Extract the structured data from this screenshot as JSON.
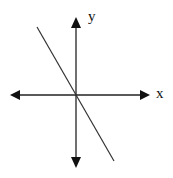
{
  "diagram": {
    "type": "coordinate-plane",
    "axes": {
      "x_label": "x",
      "y_label": "y",
      "origin": [
        76,
        95
      ],
      "x_axis": {
        "from": [
          10,
          95
        ],
        "to": [
          150,
          95
        ],
        "arrows": "both"
      },
      "y_axis": {
        "from": [
          76,
          17
        ],
        "to": [
          76,
          168
        ],
        "arrows": "both"
      }
    },
    "line": {
      "description": "line through origin with negative slope",
      "from": [
        37,
        27
      ],
      "to": [
        114,
        161
      ]
    },
    "colors": {
      "ink": "#111111",
      "line": "#333333",
      "background": "#ffffff"
    }
  }
}
